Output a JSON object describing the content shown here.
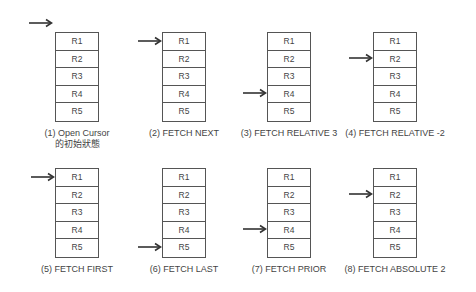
{
  "diagram": {
    "rows": [
      "R1",
      "R2",
      "R3",
      "R4",
      "R5"
    ],
    "panels": [
      {
        "caption": "(1) Open Cursor",
        "caption2": "的初始狀態",
        "pointer": "before-first"
      },
      {
        "caption": "(2) FETCH NEXT",
        "pointer": "R1"
      },
      {
        "caption": "(3) FETCH RELATIVE 3",
        "pointer": "R4"
      },
      {
        "caption": "(4) FETCH RELATIVE -2",
        "pointer": "R2"
      },
      {
        "caption": "(5) FETCH FIRST",
        "pointer": "R1"
      },
      {
        "caption": "(6) FETCH LAST",
        "pointer": "R5"
      },
      {
        "caption": "(7) FETCH PRIOR",
        "pointer": "R4"
      },
      {
        "caption": "(8) FETCH ABSOLUTE 2",
        "pointer": "R2"
      }
    ],
    "icons": {
      "pointer": "arrow-right-icon"
    }
  }
}
